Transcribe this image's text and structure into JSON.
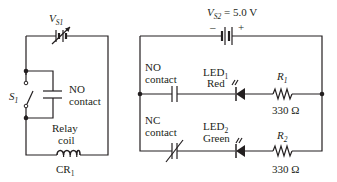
{
  "left_circuit": {
    "source": {
      "symbol": "V",
      "subscript": "S1"
    },
    "switch": {
      "symbol": "S",
      "subscript": "1"
    },
    "contact": {
      "line1": "NO",
      "line2": "contact"
    },
    "coil": {
      "line1": "Relay",
      "line2": "coil",
      "name": "CR",
      "subscript": "1"
    }
  },
  "right_circuit": {
    "source": {
      "symbol": "V",
      "subscript": "S2",
      "value": " = 5.0 V",
      "minus": "–",
      "plus": "+"
    },
    "row1": {
      "contact": {
        "line1": "NO",
        "line2": "contact"
      },
      "led": {
        "name": "LED",
        "subscript": "1",
        "color": "Red"
      },
      "resistor": {
        "symbol": "R",
        "subscript": "1",
        "value": "330 Ω"
      }
    },
    "row2": {
      "contact": {
        "line1": "NC",
        "line2": "contact"
      },
      "led": {
        "name": "LED",
        "subscript": "2",
        "color": "Green"
      },
      "resistor": {
        "symbol": "R",
        "subscript": "2",
        "value": "330 Ω"
      }
    }
  }
}
